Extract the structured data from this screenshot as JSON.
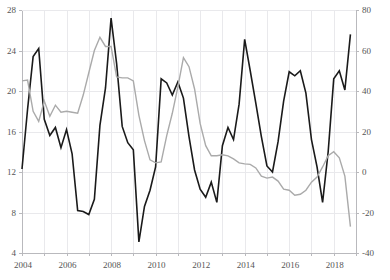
{
  "chart_data": {
    "type": "line",
    "title": "",
    "subtitle": "",
    "xlabel": "",
    "ylabel": "",
    "y2label": "",
    "grid": true,
    "legend": "none",
    "x_axis": {
      "min": 2004.0,
      "max": 2019.0,
      "tick_labels": [
        "2004",
        "2006",
        "2008",
        "2010",
        "2012",
        "2014",
        "2016",
        "2018"
      ],
      "tick_values": [
        2004,
        2006,
        2008,
        2010,
        2012,
        2014,
        2016,
        2018
      ],
      "gridline_values": [
        2004,
        2005,
        2006,
        2007,
        2008,
        2009,
        2010,
        2011,
        2012,
        2013,
        2014,
        2015,
        2016,
        2017,
        2018,
        2019
      ]
    },
    "y_axis_left": {
      "min": 4,
      "max": 28,
      "tick_labels": [
        "4",
        "8",
        "12",
        "16",
        "20",
        "24",
        "28"
      ],
      "tick_values": [
        4,
        8,
        12,
        16,
        20,
        24,
        28
      ],
      "color": "#1a1a1a"
    },
    "y_axis_right": {
      "min": -40,
      "max": 80,
      "tick_labels": [
        "-40",
        "-20",
        "0",
        "20",
        "40",
        "60",
        "80"
      ],
      "tick_values": [
        -40,
        -20,
        0,
        20,
        40,
        60,
        80
      ],
      "color": "#aaaaaa"
    },
    "series": [
      {
        "name": "black-series",
        "axis": "left",
        "color": "#1a1a1a",
        "width": 1.6,
        "x": [
          2004.0,
          2004.25,
          2004.5,
          2004.75,
          2005.0,
          2005.25,
          2005.5,
          2005.75,
          2006.0,
          2006.25,
          2006.5,
          2006.75,
          2007.0,
          2007.25,
          2007.5,
          2007.75,
          2008.0,
          2008.25,
          2008.5,
          2008.75,
          2009.0,
          2009.25,
          2009.5,
          2009.75,
          2010.0,
          2010.25,
          2010.5,
          2010.75,
          2011.0,
          2011.25,
          2011.5,
          2011.75,
          2012.0,
          2012.25,
          2012.5,
          2012.75,
          2013.0,
          2013.25,
          2013.5,
          2013.75,
          2014.0,
          2014.25,
          2014.5,
          2014.75,
          2015.0,
          2015.25,
          2015.5,
          2015.75,
          2016.0,
          2016.25,
          2016.5,
          2016.75,
          2017.0,
          2017.25,
          2017.5,
          2017.75,
          2018.0,
          2018.25,
          2018.5,
          2018.75
        ],
        "y": [
          12.3,
          18.2,
          23.4,
          24.2,
          17.2,
          15.6,
          16.4,
          14.4,
          16.2,
          13.8,
          8.2,
          8.1,
          7.8,
          9.3,
          16.6,
          20.3,
          27.2,
          22.7,
          16.5,
          14.9,
          14.2,
          5.1,
          8.6,
          10.2,
          12.5,
          21.2,
          20.8,
          19.6,
          20.9,
          19.3,
          15.5,
          12.2,
          10.3,
          9.5,
          11.0,
          9.0,
          14.6,
          16.4,
          15.2,
          18.7,
          25.1,
          22.0,
          18.8,
          15.5,
          12.6,
          12.0,
          15.0,
          19.0,
          21.9,
          21.5,
          22.0,
          19.8,
          15.2,
          12.5,
          9.0,
          14.0,
          21.2,
          22.0,
          20.1,
          25.6
        ]
      },
      {
        "name": "gray-series",
        "axis": "right",
        "color": "#aaaaaa",
        "width": 1.4,
        "x": [
          2004.0,
          2004.25,
          2004.5,
          2004.75,
          2005.0,
          2005.25,
          2005.5,
          2005.75,
          2006.0,
          2006.25,
          2006.5,
          2006.75,
          2007.0,
          2007.25,
          2007.5,
          2007.75,
          2008.0,
          2008.25,
          2008.5,
          2008.75,
          2009.0,
          2009.25,
          2009.5,
          2009.75,
          2010.0,
          2010.25,
          2010.5,
          2010.75,
          2011.0,
          2011.25,
          2011.5,
          2011.75,
          2012.0,
          2012.25,
          2012.5,
          2012.75,
          2013.0,
          2013.25,
          2013.5,
          2013.75,
          2014.0,
          2014.25,
          2014.5,
          2014.75,
          2015.0,
          2015.25,
          2015.5,
          2015.75,
          2016.0,
          2016.25,
          2016.5,
          2016.75,
          2017.0,
          2017.25,
          2017.5,
          2017.75,
          2018.0,
          2018.25,
          2018.5,
          2018.75
        ],
        "y": [
          45.0,
          45.4,
          30.0,
          25.0,
          35.0,
          27.5,
          33.0,
          29.5,
          30.0,
          29.5,
          29.0,
          38.0,
          49.0,
          60.0,
          66.5,
          62.0,
          62.0,
          47.0,
          46.5,
          46.5,
          45.0,
          28.0,
          15.5,
          6.0,
          4.5,
          5.0,
          18.0,
          29.0,
          42.0,
          56.5,
          52.0,
          41.0,
          24.0,
          13.0,
          8.0,
          8.0,
          8.5,
          8.0,
          6.5,
          4.5,
          4.0,
          3.8,
          2.0,
          -2.0,
          -3.0,
          -2.5,
          -4.5,
          -8.5,
          -9.0,
          -11.5,
          -11.0,
          -9.0,
          -5.0,
          -2.5,
          2.5,
          8.0,
          10.0,
          7.0,
          -2.0,
          -27.0
        ]
      }
    ]
  },
  "layout": {
    "plot_left": 22,
    "plot_right": 356,
    "plot_top": 10,
    "plot_bottom": 253
  }
}
